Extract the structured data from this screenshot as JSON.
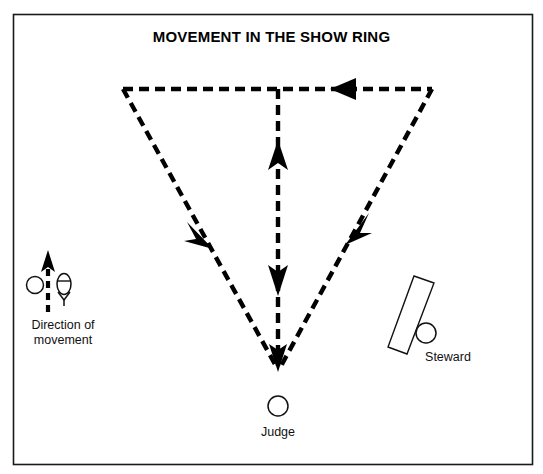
{
  "figure": {
    "title": "MOVEMENT IN THE SHOW RING",
    "border_color": "#1a1a1a",
    "background": "#ffffff",
    "line_color": "#000000"
  },
  "legend": {
    "caption": "Direction of\nmovement",
    "dog_icon": "circle-dog-icon",
    "handler_icon": "person-handler-icon",
    "arrow_icon": "up-arrow-icon"
  },
  "judge": {
    "label": "Judge",
    "marker": "circle-judge-icon"
  },
  "steward": {
    "label": "Steward",
    "marker": "circle-steward-icon",
    "table": "steward-table-icon"
  },
  "path": {
    "description": "triangular movement pattern",
    "vertices": {
      "top_left": [
        123,
        89
      ],
      "top_right": [
        432,
        89
      ],
      "apex": [
        278,
        366
      ]
    },
    "center_line": [
      [
        278,
        89
      ],
      [
        278,
        366
      ]
    ],
    "arrows": [
      {
        "name": "top-edge-arrow",
        "direction": "left",
        "x": 345,
        "y": 89
      },
      {
        "name": "left-diagonal-arrow",
        "direction": "down-left",
        "x": 203,
        "y": 232
      },
      {
        "name": "right-diagonal-arrow",
        "direction": "up-right",
        "x": 355,
        "y": 228
      },
      {
        "name": "center-up-arrow",
        "direction": "up",
        "x": 278,
        "y": 155
      },
      {
        "name": "center-down-arrow",
        "direction": "down",
        "x": 278,
        "y": 278
      },
      {
        "name": "apex-arrow",
        "direction": "down",
        "x": 278,
        "y": 366
      }
    ]
  }
}
